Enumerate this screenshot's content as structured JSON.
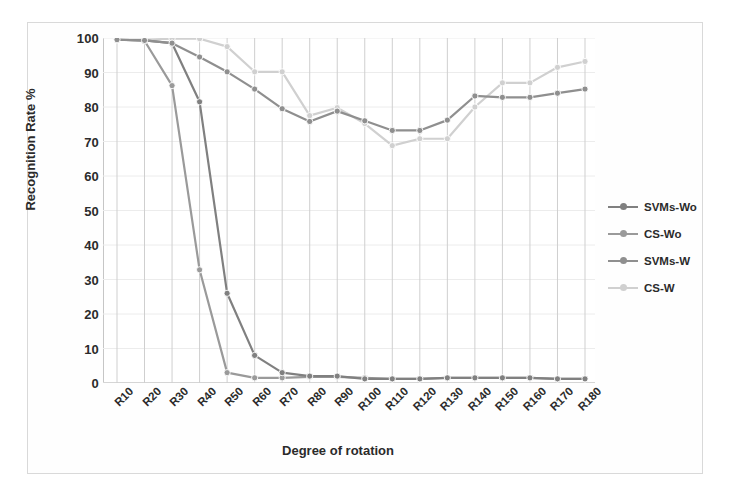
{
  "chart_data": {
    "type": "line",
    "title": "",
    "subtitle": "",
    "xlabel": "Degree of rotation",
    "ylabel": "Recognition Rate %",
    "ylim": [
      0,
      100
    ],
    "ytick_step": 10,
    "yticks": [
      "100",
      "90",
      "80",
      "70",
      "60",
      "50",
      "40",
      "30",
      "20",
      "10",
      "0"
    ],
    "grid": "vertical-only",
    "legend_position": "right",
    "categories": [
      "R10",
      "R20",
      "R30",
      "R40",
      "R50",
      "R60",
      "R70",
      "R80",
      "R90",
      "R100",
      "R110",
      "R120",
      "R130",
      "R140",
      "R150",
      "R160",
      "R170",
      "R180"
    ],
    "series": [
      {
        "name": "SVMs-Wo",
        "color": "#808080",
        "values": [
          99.5,
          99.3,
          98.5,
          81.5,
          26.0,
          8.0,
          3.0,
          2.0,
          2.0,
          1.2,
          1.2,
          1.2,
          1.5,
          1.5,
          1.5,
          1.5,
          1.2,
          1.2
        ]
      },
      {
        "name": "CS-Wo",
        "color": "#9a9a9a",
        "values": [
          99.5,
          99.2,
          86.2,
          32.8,
          3.0,
          1.5,
          1.5,
          1.8,
          1.8,
          1.5,
          1.2,
          1.2,
          1.5,
          1.5,
          1.5,
          1.5,
          1.2,
          1.2
        ]
      },
      {
        "name": "SVMs-W",
        "color": "#8f8f8f",
        "values": [
          99.5,
          99.3,
          98.5,
          94.5,
          90.2,
          85.2,
          79.5,
          75.8,
          78.8,
          76.0,
          73.2,
          73.2,
          76.2,
          83.2,
          82.8,
          82.8,
          84.0,
          85.2
        ]
      },
      {
        "name": "CS-W",
        "color": "#d0d0d0",
        "values": [
          99.5,
          99.5,
          99.8,
          99.8,
          97.5,
          90.2,
          90.2,
          77.5,
          79.8,
          75.2,
          68.8,
          70.8,
          70.8,
          80.0,
          87.0,
          87.0,
          91.5,
          93.2
        ]
      }
    ]
  },
  "legend": {
    "items": [
      {
        "label": "SVMs-Wo"
      },
      {
        "label": "CS-Wo"
      },
      {
        "label": "SVMs-W"
      },
      {
        "label": "CS-W"
      }
    ]
  },
  "colors": {
    "svms_wo": "#808080",
    "cs_wo": "#9a9a9a",
    "svms_w": "#8f8f8f",
    "cs_w": "#d0d0d0",
    "gridline": "#cfcfcf",
    "axis": "#bdbdbd",
    "text": "#2b2b2b"
  }
}
